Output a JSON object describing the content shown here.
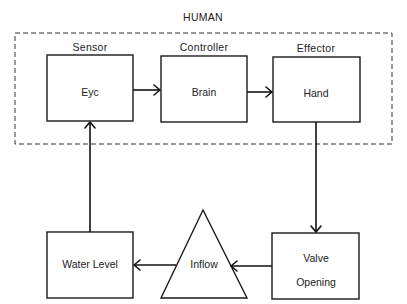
{
  "group": {
    "label": "HUMAN"
  },
  "nodes": {
    "eye": {
      "role": "Sensor",
      "label": "Eyc"
    },
    "brain": {
      "role": "Controller",
      "label": "Brain"
    },
    "hand": {
      "role": "Effector",
      "label": "Hand"
    },
    "valve": {
      "label_line1": "Valve",
      "label_line2": "Opening"
    },
    "inflow": {
      "label": "Inflow"
    },
    "water": {
      "label": "Water Level"
    }
  },
  "edges": [
    {
      "from": "Eyc",
      "to": "Brain"
    },
    {
      "from": "Brain",
      "to": "Hand"
    },
    {
      "from": "Hand",
      "to": "Valve Opening"
    },
    {
      "from": "Valve Opening",
      "to": "Inflow"
    },
    {
      "from": "Inflow",
      "to": "Water Level"
    },
    {
      "from": "Water Level",
      "to": "Eyc"
    }
  ]
}
